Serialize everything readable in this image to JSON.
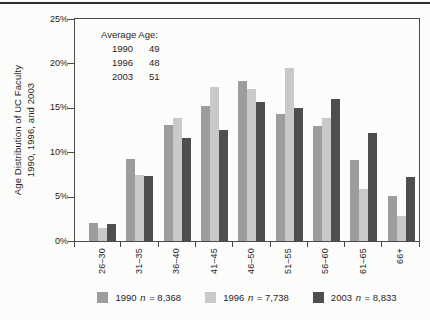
{
  "chart_data": {
    "type": "bar",
    "title": "",
    "y_axis_title_lines": [
      "Age Distribution of UC Faculty",
      "1990, 1996, and 2003"
    ],
    "categories": [
      "26–30",
      "31–35",
      "36–40",
      "41–45",
      "46–50",
      "51–55",
      "56–60",
      "61–65",
      "66+"
    ],
    "series": [
      {
        "name": "1990",
        "count": "8,368",
        "values": [
          2.0,
          9.2,
          13.1,
          15.2,
          18.0,
          14.3,
          13.0,
          9.1,
          5.1
        ]
      },
      {
        "name": "1996",
        "count": "7,738",
        "values": [
          1.5,
          7.4,
          13.9,
          17.3,
          17.1,
          19.5,
          13.9,
          5.9,
          2.8
        ]
      },
      {
        "name": "2003",
        "count": "8,833",
        "values": [
          1.9,
          7.3,
          11.6,
          12.5,
          15.6,
          15.0,
          16.0,
          12.2,
          7.2
        ]
      }
    ],
    "colors": [
      "#9d9d9d",
      "#c9c9c9",
      "#4e4e4e"
    ],
    "ylim": [
      0,
      25
    ],
    "yticks": [
      {
        "value": 0,
        "label": "0%"
      },
      {
        "value": 5,
        "label": "5%"
      },
      {
        "value": 10,
        "label": "10%"
      },
      {
        "value": 15,
        "label": "15%"
      },
      {
        "value": 20,
        "label": "20%"
      },
      {
        "value": 25,
        "label": "25%"
      }
    ],
    "grid": false,
    "legend_position": "bottom",
    "legend": {
      "n_label": "n",
      "eq": "="
    },
    "annotation": {
      "title": "Average Age:",
      "rows": [
        {
          "year": "1990",
          "age": "49"
        },
        {
          "year": "1996",
          "age": "48"
        },
        {
          "year": "2003",
          "age": "51"
        }
      ]
    }
  },
  "ui": {
    "axis_color": "#4a4a4a",
    "text_color": "#1f1f1f",
    "rule_color": "#2e2e2e"
  }
}
